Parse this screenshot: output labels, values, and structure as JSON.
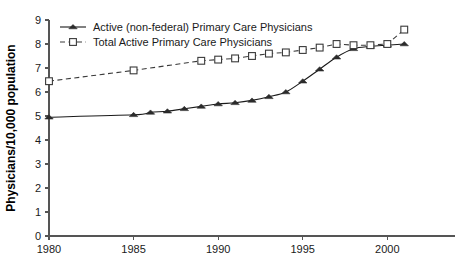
{
  "chart_data": {
    "type": "line",
    "title": "",
    "xlabel": "",
    "ylabel": "Physicians/10,000 population",
    "xlim": [
      1980,
      2004
    ],
    "ylim": [
      0,
      9
    ],
    "xticks": [
      1980,
      1985,
      1990,
      1995,
      2000
    ],
    "xtick_labels": [
      "1980",
      "1985",
      "1990",
      "1995",
      "2000"
    ],
    "yticks": [
      0,
      1,
      2,
      3,
      4,
      5,
      6,
      7,
      8,
      9
    ],
    "ytick_labels": [
      "0",
      "1",
      "2",
      "3",
      "4",
      "5",
      "6",
      "7",
      "8",
      "9"
    ],
    "grid": false,
    "legend_position": "top-left",
    "series": [
      {
        "name": "Active (non-federal) Primary Care Physicians",
        "marker": "filled-triangle",
        "line_style": "solid",
        "color": "#2b2b2b",
        "x": [
          1980,
          1985,
          1986,
          1987,
          1988,
          1989,
          1990,
          1991,
          1992,
          1993,
          1994,
          1995,
          1996,
          1997,
          1998,
          1999,
          2000,
          2001
        ],
        "values": [
          4.95,
          5.05,
          5.15,
          5.2,
          5.3,
          5.4,
          5.5,
          5.55,
          5.65,
          5.8,
          6.0,
          6.45,
          6.95,
          7.45,
          7.8,
          7.9,
          7.95,
          8.0
        ]
      },
      {
        "name": "Total Active Primary Care Physicians",
        "marker": "open-square",
        "line_style": "dashed",
        "color": "#3a3a3a",
        "x": [
          1980,
          1985,
          1989,
          1990,
          1991,
          1992,
          1993,
          1994,
          1995,
          1996,
          1997,
          1998,
          1999,
          2000,
          2001
        ],
        "values": [
          6.45,
          6.9,
          7.3,
          7.35,
          7.4,
          7.5,
          7.6,
          7.65,
          7.75,
          7.85,
          8.0,
          7.95,
          7.95,
          8.0,
          8.6
        ]
      }
    ]
  },
  "legend": {
    "items": [
      {
        "label": "Active (non-federal) Primary Care Physicians",
        "marker": "filled-triangle",
        "line_style": "solid"
      },
      {
        "label": "Total Active Primary Care Physicians",
        "marker": "open-square",
        "line_style": "dashed"
      }
    ]
  }
}
